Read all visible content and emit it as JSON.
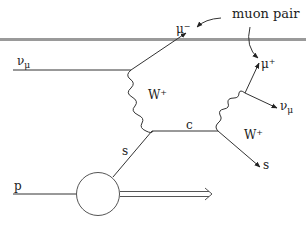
{
  "diagram": {
    "annotation": "muon pair",
    "labels": {
      "incoming_neutrino": {
        "base": "ν",
        "sub": "μ"
      },
      "outgoing_muon_minus": {
        "base": "μ",
        "sup": "−"
      },
      "w_boson_left": {
        "base": "W",
        "sup": "+"
      },
      "strange_quark_in": "s",
      "charm_quark": "c",
      "w_boson_right": {
        "base": "W",
        "sup": "+"
      },
      "muon_plus": {
        "base": "μ",
        "sup": "+"
      },
      "outgoing_neutrino": {
        "base": "ν",
        "sub": "μ"
      },
      "strange_quark_out": "s",
      "proton": "p"
    },
    "colors": {
      "line": "#333333",
      "separator_bar": "#999999",
      "background": "#ffffff"
    }
  }
}
